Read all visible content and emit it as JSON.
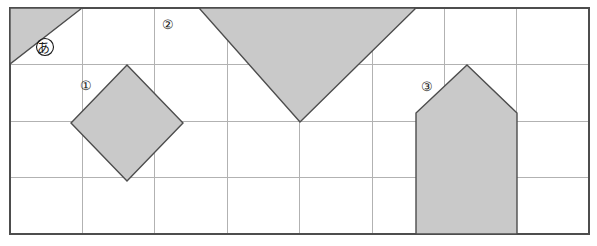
{
  "figure": {
    "type": "grid-diagram",
    "canvas": {
      "width": 597,
      "height": 246
    },
    "grid": {
      "left": 10,
      "top": 8,
      "right": 589,
      "bottom": 234,
      "columns": 8,
      "rows": 4,
      "cell_width": 72.4,
      "cell_height": 56.5,
      "line_color": "#b0b0b0",
      "border_color": "#4d4d4d"
    },
    "shape_style": {
      "fill": "#c9c9c9",
      "stroke": "#4d4d4d",
      "stroke_width": 1.4
    },
    "shapes": [
      {
        "name": "small-right-triangle",
        "label": "あ",
        "label_style": "circled",
        "points": "10,8 82,8 10,64"
      },
      {
        "name": "tilted-square",
        "label": "①",
        "label_style": "circled",
        "points": "127,65 183,123 127,181 71,123"
      },
      {
        "name": "large-inverted-triangle",
        "label": "②",
        "label_style": "circled",
        "points": "199,8 416,8 300,122"
      },
      {
        "name": "house-pentagon",
        "label": "③",
        "label_style": "circled",
        "points": "467,65 517,113 517,234 416,234 416,113"
      }
    ],
    "labels": [
      {
        "name": "label-a",
        "text": "あ",
        "x": 45,
        "y": 48,
        "inside_shape": true
      },
      {
        "name": "label-1",
        "text": "①",
        "x": 88,
        "y": 86,
        "inside_shape": false
      },
      {
        "name": "label-2",
        "text": "②",
        "x": 170,
        "y": 26,
        "inside_shape": false
      },
      {
        "name": "label-3",
        "text": "③",
        "x": 429,
        "y": 87,
        "inside_shape": false
      }
    ]
  }
}
